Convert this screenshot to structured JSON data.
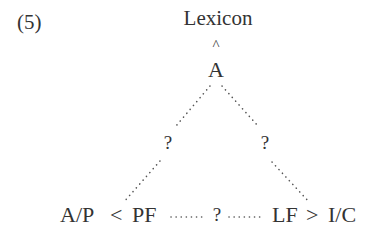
{
  "example_number": "(5)",
  "nodes": {
    "top": "Lexicon",
    "caret": "^",
    "root": "A",
    "left_question": "?",
    "right_question": "?",
    "middle_question": "?"
  },
  "bottom_row": {
    "left_system": "A/P",
    "less_than": "<",
    "pf": "PF",
    "lf": "LF",
    "greater_than": ">",
    "right_system": "I/C"
  },
  "colors": {
    "text": "#333333",
    "dots": "#555555",
    "background": "#ffffff"
  }
}
